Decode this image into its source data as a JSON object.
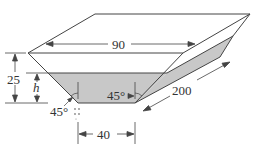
{
  "diagram": {
    "type": "trough-trapezoidal-prism",
    "colors": {
      "line": "#444444",
      "water": "#c8c8c8",
      "background": "#ffffff"
    },
    "labels": {
      "top_width": "90",
      "total_height": "25",
      "water_height": "h",
      "bottom_width": "40",
      "length": "200",
      "angle_left": "45°",
      "angle_right": "45°"
    },
    "icons": {
      "drip": "water-drip-icon"
    }
  }
}
